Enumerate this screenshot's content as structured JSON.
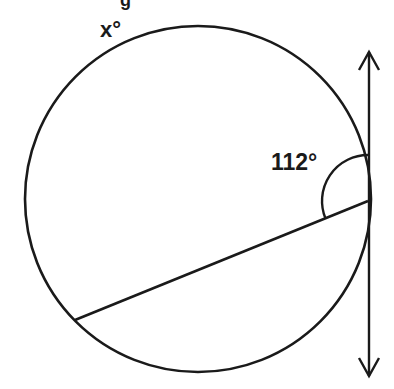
{
  "figure": {
    "type": "circle-tangent-chord-angle",
    "labels": {
      "arc_label": "x°",
      "angle_label": "112°",
      "cropped_top_text": "g"
    },
    "colors": {
      "stroke": "#1a1a1a",
      "background": "#ffffff"
    },
    "circle": {
      "cx": 198,
      "cy": 199,
      "r": 173
    },
    "tangent_line": {
      "x": 369,
      "y_top": 78,
      "y_bottom": 350,
      "arrows": "both"
    },
    "chord": {
      "x1": 75,
      "y1": 320,
      "x2": 368,
      "y2": 201
    },
    "angle_arc": {
      "cx": 368,
      "cy": 201,
      "r": 46,
      "degrees": 112
    }
  }
}
